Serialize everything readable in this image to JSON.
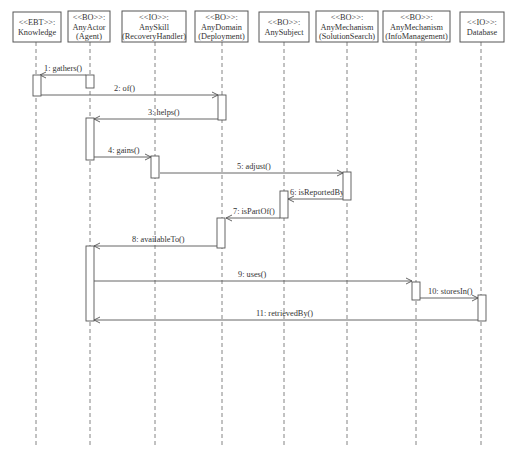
{
  "diagram": {
    "type": "sequence",
    "objects": [
      {
        "id": "knowledge",
        "stereotype": "<<EBT>>:",
        "name": "Knowledge",
        "role": "",
        "x": 36,
        "box": [
          13,
          12,
          48,
          30
        ]
      },
      {
        "id": "anyactor",
        "stereotype": "<<BO>>:",
        "name": "AnyActor",
        "role": "(Agent)",
        "x": 90,
        "box": [
          68,
          11,
          42,
          31
        ]
      },
      {
        "id": "anyskill",
        "stereotype": "<<IO>>:",
        "name": "AnySkill",
        "role": "(RecoveryHandler)",
        "x": 155,
        "box": [
          122,
          11,
          64,
          31
        ]
      },
      {
        "id": "anydomain",
        "stereotype": "<<BO>>:",
        "name": "AnyDomain",
        "role": "(Deployment)",
        "x": 222,
        "box": [
          195,
          11,
          53,
          31
        ]
      },
      {
        "id": "anysubject",
        "stereotype": "<<BO>>:",
        "name": "AnySubject",
        "role": "",
        "x": 284,
        "box": [
          259,
          12,
          50,
          30
        ]
      },
      {
        "id": "solutionsearch",
        "stereotype": "<<BO>>:",
        "name": "AnyMechanism",
        "role": "(SolutionSearch)",
        "x": 347,
        "box": [
          316,
          11,
          62,
          31
        ]
      },
      {
        "id": "infomanagement",
        "stereotype": "<<BO>>:",
        "name": "AnyMechanism",
        "role": "(InfoManagement)",
        "x": 416,
        "box": [
          383,
          11,
          67,
          31
        ]
      },
      {
        "id": "database",
        "stereotype": "<<IO>>:",
        "name": "Database",
        "role": "",
        "x": 481,
        "box": [
          460,
          12,
          44,
          30
        ]
      }
    ],
    "lifeline_end_y": 446,
    "activations": [
      {
        "obj": "knowledge",
        "x": 33,
        "y1": 75,
        "y2": 96
      },
      {
        "obj": "anyactor",
        "x": 86,
        "y1": 75,
        "y2": 88
      },
      {
        "obj": "anydomain",
        "x": 218,
        "y1": 95,
        "y2": 120
      },
      {
        "obj": "anyactor",
        "x": 86,
        "y1": 118,
        "y2": 160
      },
      {
        "obj": "anyskill",
        "x": 151,
        "y1": 156,
        "y2": 178
      },
      {
        "obj": "solutionsearch",
        "x": 343,
        "y1": 172,
        "y2": 200
      },
      {
        "obj": "anysubject",
        "x": 280,
        "y1": 191,
        "y2": 218
      },
      {
        "obj": "anydomain",
        "x": 217,
        "y1": 218,
        "y2": 248
      },
      {
        "obj": "anyactor",
        "x": 86,
        "y1": 246,
        "y2": 321
      },
      {
        "obj": "infomanagement",
        "x": 412,
        "y1": 282,
        "y2": 300
      },
      {
        "obj": "database",
        "x": 478,
        "y1": 295,
        "y2": 321
      }
    ],
    "messages": [
      {
        "seq": 1,
        "label": "1: gathers()",
        "from_x": 86,
        "to_x": 40,
        "y": 75,
        "label_x": 44,
        "label_y": 71
      },
      {
        "seq": 2,
        "label": "2: of()",
        "from_x": 40,
        "to_x": 218,
        "y": 95,
        "label_x": 114,
        "label_y": 91
      },
      {
        "seq": 3,
        "label": "3: helps()",
        "from_x": 218,
        "to_x": 94,
        "y": 119,
        "label_x": 148,
        "label_y": 115
      },
      {
        "seq": 4,
        "label": "4: gains()",
        "from_x": 94,
        "to_x": 151,
        "y": 157,
        "label_x": 108,
        "label_y": 153
      },
      {
        "seq": 5,
        "label": "5: adjust()",
        "from_x": 160,
        "to_x": 343,
        "y": 173,
        "label_x": 237,
        "label_y": 169
      },
      {
        "seq": 6,
        "label": "6: isReportedBy()",
        "from_x": 343,
        "to_x": 288,
        "y": 199,
        "label_x": 290,
        "label_y": 195
      },
      {
        "seq": 7,
        "label": "7: isPartOf()",
        "from_x": 280,
        "to_x": 226,
        "y": 218,
        "label_x": 233,
        "label_y": 214
      },
      {
        "seq": 8,
        "label": "8: availableTo()",
        "from_x": 217,
        "to_x": 94,
        "y": 246,
        "label_x": 132,
        "label_y": 242
      },
      {
        "seq": 9,
        "label": "9: uses()",
        "from_x": 94,
        "to_x": 412,
        "y": 281,
        "label_x": 238,
        "label_y": 277
      },
      {
        "seq": 10,
        "label": "10: storesIn()",
        "from_x": 420,
        "to_x": 478,
        "y": 298,
        "label_x": 428,
        "label_y": 294
      },
      {
        "seq": 11,
        "label": "11: retrievedBy()",
        "from_x": 478,
        "to_x": 94,
        "y": 320,
        "label_x": 256,
        "label_y": 316
      }
    ]
  }
}
